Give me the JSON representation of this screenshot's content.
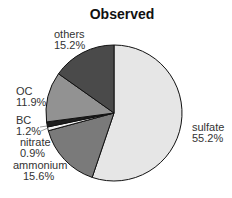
{
  "chart_data": {
    "type": "pie",
    "title": "Observed",
    "categories": [
      "sulfate",
      "ammonium",
      "nitrate",
      "BC",
      "OC",
      "others"
    ],
    "values": [
      55.2,
      15.6,
      0.9,
      1.2,
      11.9,
      15.2
    ],
    "value_labels": [
      "55.2%",
      "15.6%",
      "0.9%",
      "1.2%",
      "11.9%",
      "15.2%"
    ],
    "colors": [
      "#e6e6e6",
      "#7a7a7a",
      "#f2f2f2",
      "#1e1e1e",
      "#929292",
      "#4a4a4a"
    ],
    "start_angle": "12 o'clock",
    "direction": "clockwise",
    "legend": "none (direct labels)"
  },
  "labels": {
    "sulfate": {
      "name": "sulfate",
      "pct": "55.2%"
    },
    "ammonium": {
      "name": "ammonium",
      "pct": "15.6%"
    },
    "nitrate": {
      "name": "nitrate",
      "pct": "0.9%"
    },
    "bc": {
      "name": "BC",
      "pct": "1.2%"
    },
    "oc": {
      "name": "OC",
      "pct": "11.9%"
    },
    "others": {
      "name": "others",
      "pct": "15.2%"
    }
  }
}
